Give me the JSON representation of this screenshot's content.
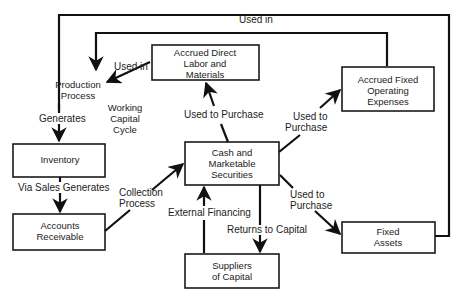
{
  "diagram": {
    "title": "Working Capital Cycle",
    "nodes": {
      "production": {
        "line1": "Production",
        "line2": "Process"
      },
      "labor": {
        "line1": "Accrued Direct",
        "line2": "Labor and",
        "line3": "Materials"
      },
      "fixed_exp": {
        "line1": "Accrued Fixed",
        "line2": "Operating",
        "line3": "Expenses"
      },
      "inventory": {
        "line1": "Inventory"
      },
      "cash": {
        "line1": "Cash and",
        "line2": "Marketable",
        "line3": "Securities"
      },
      "receivable": {
        "line1": "Accounts",
        "line2": "Receivable"
      },
      "fixed_assets": {
        "line1": "Fixed",
        "line2": "Assets"
      },
      "suppliers": {
        "line1": "Suppliers",
        "line2": "of Capital"
      }
    },
    "center_label": {
      "line1": "Working",
      "line2": "Capital",
      "line3": "Cycle"
    },
    "edges": {
      "used_in_top": "Used in",
      "used_in_labor": "Used in",
      "generates": "Generates",
      "via_sales": "Via Sales Generates",
      "collection": {
        "line1": "Collection",
        "line2": "Process"
      },
      "used_to_purchase_labor": "Used to Purchase",
      "used_to_purchase_fixed_exp": {
        "line1": "Used to",
        "line2": "Purchase"
      },
      "used_to_purchase_fixed_assets": {
        "line1": "Used to",
        "line2": "Purchase"
      },
      "external_financing": "External Financing",
      "returns_to_capital": "Returns to Capital"
    }
  }
}
